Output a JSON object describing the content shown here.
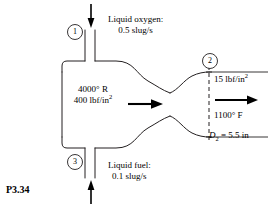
{
  "figure": {
    "caption": "P3.34",
    "stations": [
      {
        "id": "1",
        "number": "1",
        "name": "station-1-oxygen-inlet"
      },
      {
        "id": "2",
        "number": "2",
        "name": "station-2-nozzle-exit"
      },
      {
        "id": "3",
        "number": "3",
        "number_label": "3",
        "name": "station-3-fuel-inlet"
      }
    ],
    "inlets": {
      "oxygen": {
        "title": "Liquid oxygen:",
        "flow_rate": "0.5 slug/s",
        "arrow_direction": "down"
      },
      "fuel": {
        "title": "Liquid fuel:",
        "flow_rate": "0.1 slug/s",
        "arrow_direction": "up"
      }
    },
    "chamber": {
      "temperature": "4000° R",
      "pressure_value": "400 lbf/in",
      "pressure_exponent": "2",
      "arrow_direction": "right"
    },
    "exit": {
      "pressure_value": "15 lbf/in",
      "pressure_exponent": "2",
      "temperature": "1100° F",
      "diameter_symbol": "D",
      "diameter_subscript": "2",
      "diameter_value": " = 5.5 in",
      "arrow_direction": "right"
    },
    "colors": {
      "stroke": "#231f20",
      "background": "#ffffff",
      "arrow": "#000000"
    }
  }
}
